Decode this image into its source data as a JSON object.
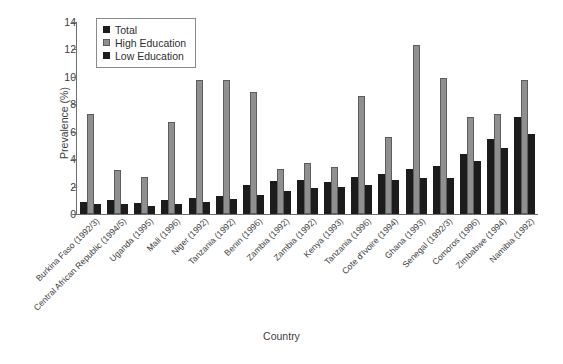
{
  "chart_data": {
    "type": "bar",
    "title": "",
    "xlabel": "Country",
    "ylabel": "Prevalence (%)",
    "ylim": [
      0,
      14
    ],
    "yticks": [
      0,
      2,
      4,
      6,
      8,
      10,
      12,
      14
    ],
    "grid": false,
    "legend_position": "top-left",
    "categories": [
      "Burkina Faso (1992/3)",
      "Central African Republic (1994/5)",
      "Uganda (1995)",
      "Mali (1996)",
      "Niger (1992)",
      "Tanzania (1992)",
      "Benin (1996)",
      "Zambia (1992)",
      "Zambia (1992)",
      "Kenya (1993)",
      "Tanzania (1996)",
      "Cote d'Ivoire (1994)",
      "Ghana (1993)",
      "Senegal (1992/3)",
      "Comoros (1996)",
      "Zimbabwe (1994)",
      "Namibia (1992)"
    ],
    "series": [
      {
        "name": "Total",
        "color": "#1c1c1c",
        "values": [
          0.9,
          1.0,
          0.8,
          1.0,
          1.2,
          1.3,
          2.1,
          2.4,
          2.5,
          2.3,
          2.7,
          2.9,
          3.3,
          3.5,
          4.4,
          5.5,
          7.1
        ]
      },
      {
        "name": "High Education",
        "color": "#8f8f8f",
        "values": [
          7.3,
          3.2,
          2.7,
          6.7,
          9.8,
          9.8,
          8.9,
          3.3,
          3.7,
          3.4,
          8.6,
          5.6,
          12.3,
          9.9,
          7.1,
          7.3,
          9.8
        ]
      },
      {
        "name": "Low Education",
        "color": "#1c1c1c",
        "values": [
          0.7,
          0.7,
          0.6,
          0.7,
          0.9,
          1.1,
          1.4,
          1.7,
          1.9,
          2.0,
          2.1,
          2.5,
          2.6,
          2.6,
          3.9,
          4.8,
          5.8
        ]
      }
    ]
  },
  "legend": {
    "items": [
      {
        "label": "Total"
      },
      {
        "label": "High Education"
      },
      {
        "label": "Low Education"
      }
    ]
  }
}
